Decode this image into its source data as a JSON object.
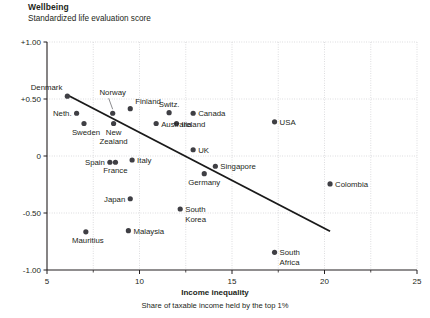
{
  "header": {
    "title": "Wellbeing",
    "subtitle": "Standardized life evaluation score"
  },
  "footer": {
    "xaxis_title": "Income inequality",
    "xaxis_subtitle": "Share of taxable income held by the top 1%"
  },
  "chart_data": {
    "type": "scatter",
    "title": "Wellbeing",
    "subtitle": "Standardized life evaluation score",
    "xlabel": "Income inequality",
    "xlabel_sub": "Share of taxable income held by the top 1%",
    "ylabel": "Standardized life evaluation score",
    "xlim": [
      5,
      25
    ],
    "ylim": [
      -1.0,
      1.0
    ],
    "xticks": [
      5,
      10,
      15,
      20,
      25
    ],
    "xtick_labels": [
      "5",
      "10",
      "15",
      "20",
      "25"
    ],
    "xminor_ticks": [
      7.5,
      12.5,
      17.5,
      22.5
    ],
    "yticks": [
      1.0,
      0.5,
      0,
      -0.5,
      -1.0
    ],
    "ytick_labels": [
      "+1.00",
      "+0.50",
      "0",
      "-0.50",
      "-1.00"
    ],
    "grid": "dotted-both",
    "legend": "none",
    "marker_color": "#3f3f44",
    "trendline": {
      "label": "linear fit",
      "x": [
        6.1,
        20.3
      ],
      "y": [
        0.535,
        -0.66
      ],
      "color": "#1a1a1a"
    },
    "points": [
      {
        "name": "Denmark",
        "x": 6.1,
        "y": 0.525,
        "label_pos": "above-left"
      },
      {
        "name": "Neth.",
        "x": 6.6,
        "y": 0.375,
        "label_pos": "left"
      },
      {
        "name": "Sweden",
        "x": 7.0,
        "y": 0.285,
        "label_pos": "below-left"
      },
      {
        "name": "Mauritius",
        "x": 7.1,
        "y": -0.665,
        "label_pos": "below-left"
      },
      {
        "name": "Norway",
        "x": 8.55,
        "y": 0.375,
        "label_pos": "leader-above"
      },
      {
        "name": "New Zealand",
        "x": 8.6,
        "y": 0.285,
        "label_pos": "below"
      },
      {
        "name": "Spain",
        "x": 8.4,
        "y": -0.055,
        "label_pos": "left"
      },
      {
        "name": "France",
        "x": 8.7,
        "y": -0.055,
        "label_pos": "below"
      },
      {
        "name": "Finland",
        "x": 9.5,
        "y": 0.415,
        "label_pos": "above-right"
      },
      {
        "name": "Italy",
        "x": 9.6,
        "y": -0.035,
        "label_pos": "right"
      },
      {
        "name": "Japan",
        "x": 9.5,
        "y": -0.375,
        "label_pos": "left"
      },
      {
        "name": "Malaysia",
        "x": 9.4,
        "y": -0.655,
        "label_pos": "right"
      },
      {
        "name": "Australia",
        "x": 10.9,
        "y": 0.285,
        "label_pos": "right"
      },
      {
        "name": "Switz.",
        "x": 11.6,
        "y": 0.38,
        "label_pos": "above"
      },
      {
        "name": "Ireland",
        "x": 12.0,
        "y": 0.285,
        "label_pos": "right"
      },
      {
        "name": "South Korea",
        "x": 12.2,
        "y": -0.465,
        "label_pos": "right"
      },
      {
        "name": "Canada",
        "x": 12.9,
        "y": 0.375,
        "label_pos": "right"
      },
      {
        "name": "UK",
        "x": 12.9,
        "y": 0.055,
        "label_pos": "right"
      },
      {
        "name": "Germany",
        "x": 13.5,
        "y": -0.155,
        "label_pos": "below"
      },
      {
        "name": "Singapore",
        "x": 14.1,
        "y": -0.09,
        "label_pos": "right"
      },
      {
        "name": "USA",
        "x": 17.3,
        "y": 0.3,
        "label_pos": "right"
      },
      {
        "name": "South Africa",
        "x": 17.3,
        "y": -0.845,
        "label_pos": "right"
      },
      {
        "name": "Colombia",
        "x": 20.3,
        "y": -0.245,
        "label_pos": "right"
      }
    ]
  }
}
